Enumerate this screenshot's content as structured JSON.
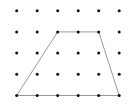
{
  "diagram": {
    "type": "dot-grid-with-polygon",
    "grid": {
      "columns": 6,
      "rows": 5,
      "origin_x": 16.7,
      "origin_y": 10.7,
      "spacing_x": 20.5,
      "spacing_y": 21.2,
      "dot_radius": 1.5,
      "dot_color": "#111111"
    },
    "shape": {
      "name": "trapezoid",
      "vertices_grid": [
        [
          2,
          1
        ],
        [
          4,
          1
        ],
        [
          5,
          4
        ],
        [
          0,
          4
        ]
      ],
      "stroke_color": "#9a9a9a",
      "stroke_width": 1
    }
  }
}
